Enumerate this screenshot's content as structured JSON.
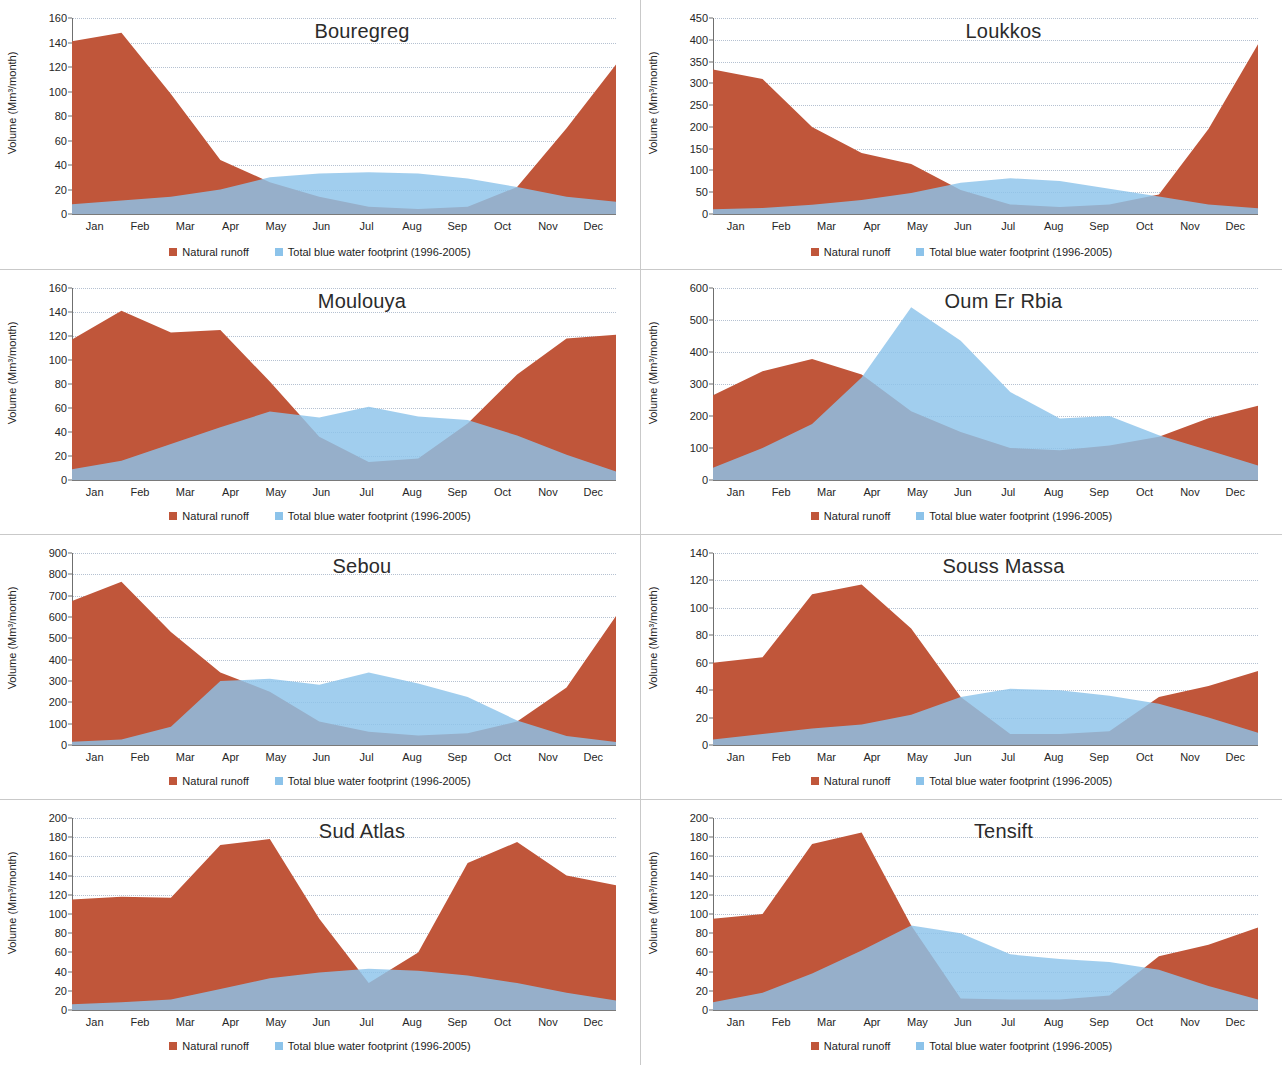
{
  "figure": {
    "y_axis_label": "Volume (Mm³/month)",
    "months": [
      "Jan",
      "Feb",
      "Mar",
      "Apr",
      "May",
      "Jun",
      "Jul",
      "Aug",
      "Sep",
      "Oct",
      "Nov",
      "Dec"
    ],
    "legend": [
      {
        "label": "Natural runoff",
        "color": "#c0563a",
        "key": "runoff"
      },
      {
        "label": "Total blue water footprint (1996-2005)",
        "color": "#8cc3ea",
        "key": "blue"
      }
    ],
    "colors": {
      "runoff": "#c0563a",
      "blue": "#8cc3ea",
      "overlap": "#5f5a96",
      "gridline": "#a9b7c9",
      "axis": "#6f6f6f",
      "panel_border": "#c9c9c9",
      "text": "#262626"
    }
  },
  "chart_data": [
    {
      "type": "area",
      "title": "Bouregreg",
      "xlabel": "",
      "ylabel": "Volume (Mm³/month)",
      "ylim": [
        0,
        160
      ],
      "ytick_step": 20,
      "yticks": [
        0,
        20,
        40,
        60,
        80,
        100,
        120,
        140,
        160
      ],
      "grid": true,
      "legend_position": "bottom",
      "categories": [
        "Jan",
        "Feb",
        "Mar",
        "Apr",
        "May",
        "Jun",
        "Jul",
        "Aug",
        "Sep",
        "Oct",
        "Nov",
        "Dec"
      ],
      "series": [
        {
          "name": "Natural runoff",
          "values": [
            141,
            148,
            98,
            44,
            26,
            14,
            6,
            4,
            6,
            22,
            70,
            122
          ]
        },
        {
          "name": "Total blue water footprint (1996-2005)",
          "values": [
            8,
            11,
            14,
            20,
            30,
            33,
            34,
            33,
            29,
            22,
            14,
            10
          ]
        }
      ]
    },
    {
      "type": "area",
      "title": "Loukkos",
      "xlabel": "",
      "ylabel": "Volume (Mm³/month)",
      "ylim": [
        0,
        450
      ],
      "ytick_step": 50,
      "yticks": [
        0,
        50,
        100,
        150,
        200,
        250,
        300,
        350,
        400,
        450
      ],
      "grid": true,
      "legend_position": "bottom",
      "categories": [
        "Jan",
        "Feb",
        "Mar",
        "Apr",
        "May",
        "Jun",
        "Jul",
        "Aug",
        "Sep",
        "Oct",
        "Nov",
        "Dec"
      ],
      "series": [
        {
          "name": "Natural runoff",
          "values": [
            332,
            310,
            200,
            140,
            115,
            55,
            22,
            16,
            22,
            45,
            195,
            390
          ]
        },
        {
          "name": "Total blue water footprint (1996-2005)",
          "values": [
            11,
            14,
            21,
            32,
            48,
            72,
            82,
            76,
            58,
            40,
            22,
            13
          ]
        }
      ]
    },
    {
      "type": "area",
      "title": "Moulouya",
      "xlabel": "",
      "ylabel": "Volume (Mm³/month)",
      "ylim": [
        0,
        160
      ],
      "ytick_step": 20,
      "yticks": [
        0,
        20,
        40,
        60,
        80,
        100,
        120,
        140,
        160
      ],
      "grid": true,
      "legend_position": "bottom",
      "categories": [
        "Jan",
        "Feb",
        "Mar",
        "Apr",
        "May",
        "Jun",
        "Jul",
        "Aug",
        "Sep",
        "Oct",
        "Nov",
        "Dec"
      ],
      "series": [
        {
          "name": "Natural runoff",
          "values": [
            117,
            141,
            123,
            125,
            82,
            36,
            15,
            18,
            47,
            88,
            118,
            121
          ]
        },
        {
          "name": "Total blue water footprint (1996-2005)",
          "values": [
            9,
            16,
            30,
            44,
            57,
            52,
            61,
            53,
            50,
            37,
            21,
            7
          ]
        }
      ]
    },
    {
      "type": "area",
      "title": "Oum Er Rbia",
      "xlabel": "",
      "ylabel": "Volume (Mm³/month)",
      "ylim": [
        0,
        600
      ],
      "ytick_step": 100,
      "yticks": [
        0,
        100,
        200,
        300,
        400,
        500,
        600
      ],
      "grid": true,
      "legend_position": "bottom",
      "categories": [
        "Jan",
        "Feb",
        "Mar",
        "Apr",
        "May",
        "Jun",
        "Jul",
        "Aug",
        "Sep",
        "Oct",
        "Nov",
        "Dec"
      ],
      "series": [
        {
          "name": "Natural runoff",
          "values": [
            265,
            340,
            378,
            330,
            215,
            150,
            100,
            93,
            108,
            135,
            193,
            232
          ]
        },
        {
          "name": "Total blue water footprint (1996-2005)",
          "values": [
            38,
            100,
            175,
            320,
            540,
            435,
            275,
            192,
            200,
            140,
            93,
            45
          ]
        }
      ]
    },
    {
      "type": "area",
      "title": "Sebou",
      "xlabel": "",
      "ylabel": "Volume (Mm³/month)",
      "ylim": [
        0,
        900
      ],
      "ytick_step": 100,
      "yticks": [
        0,
        100,
        200,
        300,
        400,
        500,
        600,
        700,
        800,
        900
      ],
      "grid": true,
      "legend_position": "bottom",
      "categories": [
        "Jan",
        "Feb",
        "Mar",
        "Apr",
        "May",
        "Jun",
        "Jul",
        "Aug",
        "Sep",
        "Oct",
        "Nov",
        "Dec"
      ],
      "series": [
        {
          "name": "Natural runoff",
          "values": [
            675,
            765,
            530,
            340,
            250,
            110,
            62,
            45,
            55,
            110,
            270,
            605
          ]
        },
        {
          "name": "Total blue water footprint (1996-2005)",
          "values": [
            15,
            26,
            85,
            300,
            310,
            282,
            340,
            288,
            225,
            115,
            42,
            14
          ]
        }
      ]
    },
    {
      "type": "area",
      "title": "Souss Massa",
      "xlabel": "",
      "ylabel": "Volume (Mm³/month)",
      "ylim": [
        0,
        140
      ],
      "ytick_step": 20,
      "yticks": [
        0,
        20,
        40,
        60,
        80,
        100,
        120,
        140
      ],
      "grid": true,
      "legend_position": "bottom",
      "categories": [
        "Jan",
        "Feb",
        "Mar",
        "Apr",
        "May",
        "Jun",
        "Jul",
        "Aug",
        "Sep",
        "Oct",
        "Nov",
        "Dec"
      ],
      "series": [
        {
          "name": "Natural runoff",
          "values": [
            60,
            64,
            110,
            117,
            85,
            35,
            8,
            8,
            10,
            35,
            43,
            54
          ]
        },
        {
          "name": "Total blue water footprint (1996-2005)",
          "values": [
            4,
            8,
            12,
            15,
            22,
            35,
            41,
            40,
            36,
            30,
            20,
            9
          ]
        }
      ]
    },
    {
      "type": "area",
      "title": "Sud Atlas",
      "xlabel": "",
      "ylabel": "Volume (Mm³/month)",
      "ylim": [
        0,
        200
      ],
      "ytick_step": 20,
      "yticks": [
        0,
        20,
        40,
        60,
        80,
        100,
        120,
        140,
        160,
        180,
        200
      ],
      "grid": true,
      "legend_position": "bottom",
      "categories": [
        "Jan",
        "Feb",
        "Mar",
        "Apr",
        "May",
        "Jun",
        "Jul",
        "Aug",
        "Sep",
        "Oct",
        "Nov",
        "Dec"
      ],
      "series": [
        {
          "name": "Natural runoff",
          "values": [
            115,
            118,
            117,
            172,
            178,
            95,
            28,
            60,
            153,
            175,
            140,
            130
          ]
        },
        {
          "name": "Total blue water footprint (1996-2005)",
          "values": [
            6,
            8,
            11,
            22,
            33,
            39,
            43,
            41,
            36,
            28,
            18,
            10
          ]
        }
      ]
    },
    {
      "type": "area",
      "title": "Tensift",
      "xlabel": "",
      "ylabel": "Volume (Mm³/month)",
      "ylim": [
        0,
        200
      ],
      "ytick_step": 20,
      "yticks": [
        0,
        20,
        40,
        60,
        80,
        100,
        120,
        140,
        160,
        180,
        200
      ],
      "grid": true,
      "legend_position": "bottom",
      "categories": [
        "Jan",
        "Feb",
        "Mar",
        "Apr",
        "May",
        "Jun",
        "Jul",
        "Aug",
        "Sep",
        "Oct",
        "Nov",
        "Dec"
      ],
      "series": [
        {
          "name": "Natural runoff",
          "values": [
            95,
            100,
            173,
            185,
            88,
            12,
            11,
            11,
            15,
            56,
            68,
            86
          ]
        },
        {
          "name": "Total blue water footprint (1996-2005)",
          "values": [
            8,
            18,
            38,
            62,
            88,
            80,
            58,
            53,
            50,
            42,
            25,
            11
          ]
        }
      ]
    }
  ]
}
